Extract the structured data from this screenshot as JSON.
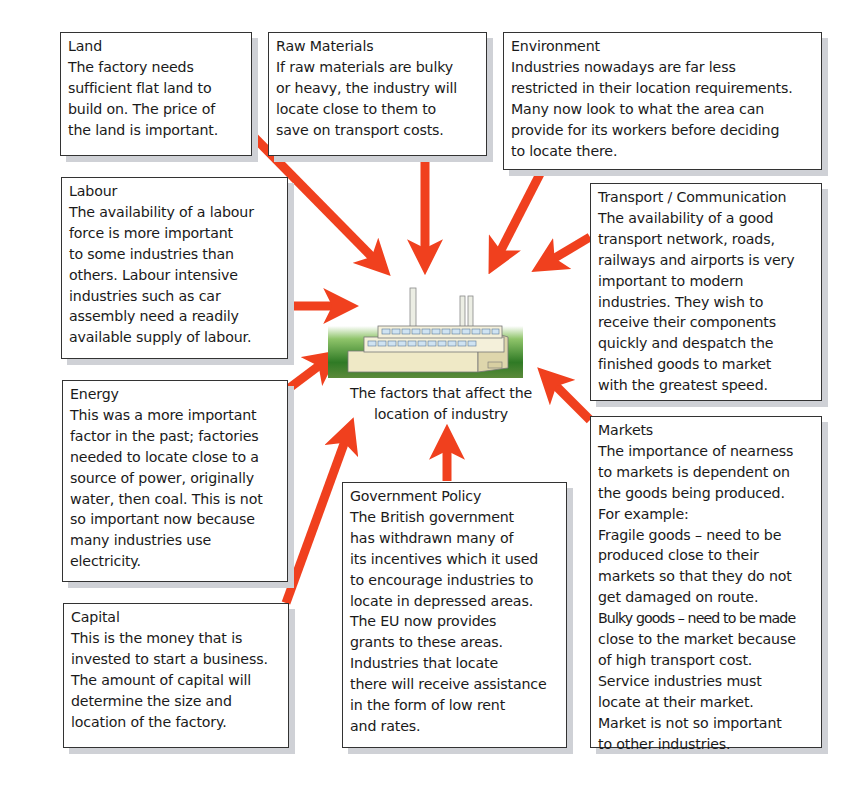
{
  "diagram": {
    "caption_lines": [
      "The factors that affect the",
      "location of industry"
    ],
    "center_icon": "factory-icon",
    "arrow_color": "#f0401e",
    "factors": [
      {
        "id": "land",
        "title": "Land",
        "lines": [
          "The factory needs",
          "sufficient flat land to",
          "build on. The price of",
          "the land is important."
        ]
      },
      {
        "id": "raw-materials",
        "title": "Raw Materials",
        "lines": [
          "If raw materials are bulky",
          "or heavy, the industry will",
          "locate close to them to",
          "save on transport costs."
        ]
      },
      {
        "id": "environment",
        "title": "Environment",
        "lines": [
          "Industries nowadays are far less",
          "restricted in their location requirements.",
          "Many now look to what the area can",
          "provide for its workers before deciding",
          "to locate there."
        ]
      },
      {
        "id": "labour",
        "title": "Labour",
        "lines": [
          "The availability of a labour",
          "force is more important",
          "to some industries than",
          "others. Labour intensive",
          "industries such as car",
          "assembly need a readily",
          "available supply of labour."
        ]
      },
      {
        "id": "transport",
        "title": "Transport / Communication",
        "lines": [
          "The availability of a good",
          "transport network, roads,",
          "railways and airports is very",
          "important to modern",
          "industries. They wish to",
          "receive their components",
          "quickly and despatch the",
          "finished goods to market",
          "with the greatest speed."
        ]
      },
      {
        "id": "energy",
        "title": "Energy",
        "lines": [
          "This was a more important",
          "factor in the past; factories",
          "needed to locate close to a",
          "source of power, originally",
          "water, then coal. This is not",
          "so important now because",
          "many industries use",
          "electricity."
        ]
      },
      {
        "id": "capital",
        "title": "Capital",
        "lines": [
          "This is the money that is",
          "invested to start a business.",
          "The amount of capital will",
          "determine the size and",
          "location of the factory."
        ]
      },
      {
        "id": "government-policy",
        "title": "Government Policy",
        "lines": [
          "The British government",
          "has withdrawn many of",
          "its incentives which it used",
          "to encourage industries to",
          "locate in depressed areas.",
          "The EU now provides",
          "grants to these areas.",
          "Industries that locate",
          "there will receive assistance",
          "in the form of low rent",
          "and rates."
        ]
      },
      {
        "id": "markets",
        "title": "Markets",
        "lines": [
          "The importance of nearness",
          "to markets is dependent on",
          "the goods being produced.",
          "For example:",
          "Fragile goods – need to be",
          "produced close to their",
          "markets so that they do not",
          "get damaged on route.",
          "Bulky goods – need to be made",
          "close to the market because",
          "of high transport cost.",
          "Service industries must",
          "locate at their market.",
          "Market is not so important",
          "to other industries."
        ]
      }
    ]
  }
}
